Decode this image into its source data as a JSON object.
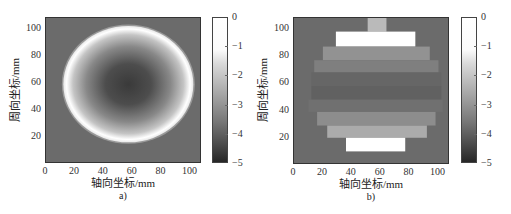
{
  "chart_data": [
    {
      "type": "heatmap",
      "panel_label": "a)",
      "title": "",
      "xlabel": "轴向坐标/mm",
      "ylabel": "周向坐标/mm",
      "xlim": [
        0,
        108
      ],
      "ylim": [
        0,
        108
      ],
      "xticks": [
        0,
        20,
        40,
        60,
        80,
        100
      ],
      "yticks": [
        20,
        40,
        60,
        80,
        100
      ],
      "grid": false,
      "colormap": "gray",
      "colorbar": {
        "range": [
          -5,
          0
        ],
        "ticks": [
          0,
          -1,
          -2,
          -3,
          -4,
          -5
        ]
      },
      "description": "Circular field: bright ring (value ~0) at the circle edge, darkening toward center (~-4.6); background ~-3.6",
      "shape": {
        "kind": "circle",
        "center_mm": [
          57,
          59
        ],
        "radius_mm": [
          45,
          43
        ],
        "edge_value": 0,
        "center_value": -4.6,
        "background_value": -3.6
      }
    },
    {
      "type": "heatmap",
      "panel_label": "b)",
      "title": "",
      "xlabel": "轴向坐标/mm",
      "ylabel": "周向坐标/mm",
      "xlim": [
        0,
        108
      ],
      "ylim": [
        0,
        108
      ],
      "xticks": [
        0,
        20,
        40,
        60,
        80,
        100
      ],
      "yticks": [
        20,
        40,
        60,
        80,
        100
      ],
      "grid": false,
      "colormap": "gray",
      "colorbar": {
        "range": [
          -5,
          0
        ],
        "ticks": [
          0,
          -1,
          -2,
          -3,
          -4,
          -5
        ]
      },
      "background_value": -3.6,
      "bands": [
        {
          "x": [
            51,
            64
          ],
          "y": [
            98,
            108
          ],
          "value": -2.0
        },
        {
          "x": [
            29,
            84
          ],
          "y": [
            87,
            98
          ],
          "value": 0.0
        },
        {
          "x": [
            20,
            94
          ],
          "y": [
            77,
            87
          ],
          "value": -2.8
        },
        {
          "x": [
            14,
            100
          ],
          "y": [
            68,
            77
          ],
          "value": -3.2
        },
        {
          "x": [
            12,
            102
          ],
          "y": [
            58,
            68
          ],
          "value": -3.7
        },
        {
          "x": [
            12,
            102
          ],
          "y": [
            48,
            58
          ],
          "value": -3.8
        },
        {
          "x": [
            10,
            103
          ],
          "y": [
            39,
            48
          ],
          "value": -3.5
        },
        {
          "x": [
            16,
            98
          ],
          "y": [
            29,
            39
          ],
          "value": -2.9
        },
        {
          "x": [
            23,
            92
          ],
          "y": [
            20,
            29
          ],
          "value": -2.3
        },
        {
          "x": [
            36,
            77
          ],
          "y": [
            10,
            20
          ],
          "value": 0.0
        }
      ]
    }
  ],
  "labels": {
    "xlabel": "轴向坐标/mm",
    "ylabel": "周向坐标/mm",
    "panel_a": "a)",
    "panel_b": "b)",
    "xticks": [
      "0",
      "20",
      "40",
      "60",
      "80",
      "100"
    ],
    "yticks": [
      "100",
      "80",
      "60",
      "40",
      "20"
    ],
    "cbticks": [
      "0",
      "−1",
      "−2",
      "−3",
      "−4",
      "−5"
    ]
  }
}
